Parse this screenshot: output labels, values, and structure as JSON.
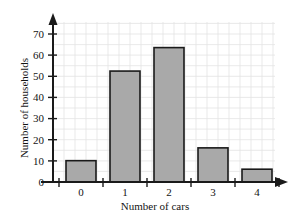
{
  "chart_data": {
    "type": "bar",
    "title": "",
    "xlabel": "Number of cars",
    "ylabel": "Number of households",
    "categories": [
      "0",
      "1",
      "2",
      "3",
      "4"
    ],
    "values": [
      10,
      52,
      63,
      16,
      6
    ],
    "ylim": [
      0,
      75
    ],
    "ytick_values": [
      0,
      10,
      20,
      30,
      40,
      50,
      60,
      70
    ],
    "ytick_labels": [
      "0",
      "10",
      "20",
      "30",
      "40",
      "50",
      "60",
      "70"
    ],
    "xlim": [
      0,
      5
    ],
    "grid": true,
    "legend": false,
    "bar_fill_color": "#a9a9a9",
    "bar_edge_color": "#1a1a1a",
    "grid_color": "#e0e0e0",
    "axis_color": "#1a1a1a",
    "text_color": "#141414"
  }
}
